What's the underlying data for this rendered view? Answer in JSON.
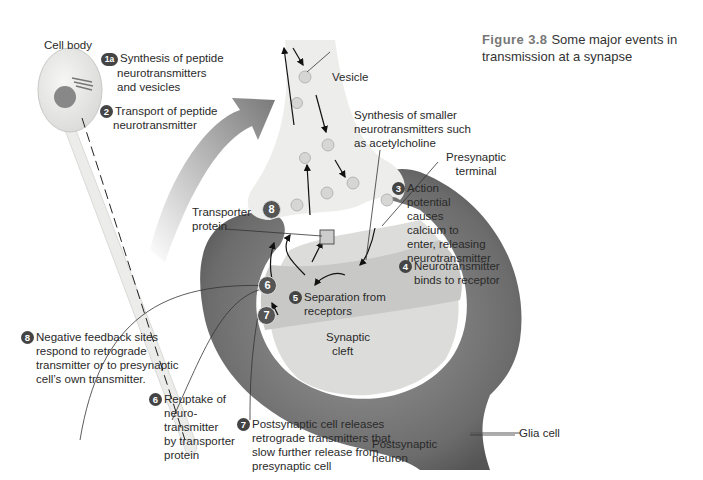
{
  "figure": {
    "number": "Figure 3.8",
    "caption_line1": "Some major events in",
    "caption_line2": "transmission at a synapse"
  },
  "labels": {
    "cell_body": "Cell body",
    "vesicle": "Vesicle",
    "synthesis_small_1": "Synthesis of smaller",
    "synthesis_small_2": "neurotransmitters such",
    "synthesis_small_3": "as acetylcholine",
    "presynaptic_1": "Presynaptic",
    "presynaptic_2": "terminal",
    "transporter_1": "Transporter",
    "transporter_2": "protein",
    "synaptic_1": "Synaptic",
    "synaptic_2": "cleft",
    "postsynaptic_1": "Postsynaptic",
    "postsynaptic_2": "neuron",
    "glia": "Glia cell"
  },
  "steps": [
    {
      "id": "1a",
      "lines": [
        "Synthesis of peptide",
        "neurotransmitters",
        "and vesicles"
      ]
    },
    {
      "id": "2",
      "lines": [
        "Transport of peptide",
        "neurotransmitter"
      ]
    },
    {
      "id": "3",
      "lines": [
        "Action",
        "potential",
        "causes",
        "calcium to",
        "enter, releasing",
        "neurotransmitter"
      ]
    },
    {
      "id": "4",
      "lines": [
        "Neurotransmitter",
        "binds to receptor"
      ]
    },
    {
      "id": "5",
      "lines": [
        "Separation from",
        "receptors"
      ]
    },
    {
      "id": "6",
      "lines": [
        "Reuptake of",
        "neuro-",
        "transmitter",
        "by transporter",
        "protein"
      ]
    },
    {
      "id": "7",
      "lines": [
        "Postsynaptic cell releases",
        "retrograde transmitters that",
        "slow further release from",
        "presynaptic cell"
      ]
    },
    {
      "id": "8",
      "lines": [
        "Negative feedback sites",
        "respond to retrograde",
        "transmitter or to presynaptic",
        "cell’s own transmitter."
      ]
    }
  ],
  "badges": {
    "b6": "6",
    "b7": "7",
    "b8": "8"
  },
  "colors": {
    "glia": "#6e6e6e",
    "neuron_fill": "#ededeb",
    "cleft": "#c9c9c7",
    "postsynaptic": "#dcdcda",
    "badge": "#4a4a4a"
  }
}
